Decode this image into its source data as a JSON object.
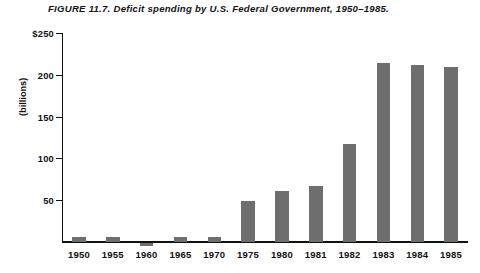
{
  "caption": "FIGURE  11.7. Deficit spending by U.S. Federal Government, 1950–1985.",
  "axis": {
    "y_title": "(billions)",
    "y_tick_labels": [
      "$250",
      "200",
      "150",
      "100",
      "50"
    ]
  },
  "colors": {
    "bar": "#6e6e6e",
    "axis": "#111111",
    "background": "#ffffff"
  },
  "chart_data": {
    "type": "bar",
    "title": "FIGURE  11.7. Deficit spending by U.S. Federal Government, 1950–1985.",
    "xlabel": "",
    "ylabel": "(billions)",
    "ylim": [
      -10,
      250
    ],
    "grid": false,
    "legend": false,
    "y_ticks": [
      50,
      100,
      150,
      200,
      250
    ],
    "y_tick_labels": [
      "50",
      "100",
      "150",
      "200",
      "$250"
    ],
    "categories": [
      "1950",
      "1955",
      "1960",
      "1965",
      "1970",
      "1975",
      "1980",
      "1981",
      "1982",
      "1983",
      "1984",
      "1985"
    ],
    "values": [
      5,
      6,
      -3,
      5,
      6,
      49,
      61,
      67,
      117,
      214,
      211,
      209
    ],
    "note": "1960 value is negative (budget surplus); bar extends below the zero axis line"
  }
}
